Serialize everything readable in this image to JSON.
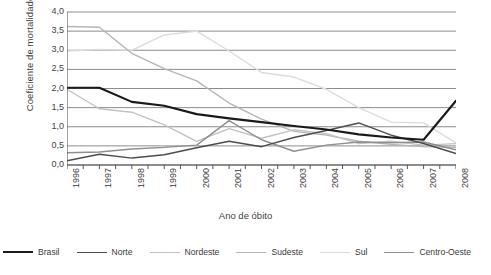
{
  "chart_data": {
    "type": "line",
    "title": "",
    "xlabel": "Ano de óbito",
    "ylabel": "Coeficiente de mortalidade",
    "categories": [
      "1996",
      "1997",
      "1998",
      "1999",
      "2000",
      "2001",
      "2002",
      "2003",
      "2004",
      "2005",
      "2006",
      "2007",
      "2008"
    ],
    "x": [
      1996,
      1997,
      1998,
      1999,
      2000,
      2001,
      2002,
      2003,
      2004,
      2005,
      2006,
      2007,
      2008
    ],
    "ylim": [
      0.0,
      4.0
    ],
    "yticks": [
      "0,0",
      "0,5",
      "1,0",
      "1,5",
      "2,0",
      "2,5",
      "3,0",
      "3,5",
      "4,0"
    ],
    "ytick_values": [
      0.0,
      0.5,
      1.0,
      1.5,
      2.0,
      2.5,
      3.0,
      3.5,
      4.0
    ],
    "grid": true,
    "legend_position": "bottom",
    "series": [
      {
        "name": "Brasil",
        "color": "#1a1a1a",
        "width": 2.1,
        "values": [
          2.02,
          2.02,
          1.65,
          1.55,
          1.33,
          1.22,
          1.12,
          1.02,
          0.93,
          0.8,
          0.72,
          0.66,
          1.68
        ]
      },
      {
        "name": "Norte",
        "color": "#4d4d4d",
        "width": 1.5,
        "values": [
          0.11,
          0.28,
          0.18,
          0.27,
          0.45,
          0.62,
          0.48,
          0.72,
          0.9,
          1.1,
          0.78,
          0.56,
          0.3
        ]
      },
      {
        "name": "Nordeste",
        "color": "#c2c2c2",
        "width": 1.4,
        "values": [
          1.98,
          1.47,
          1.38,
          1.05,
          0.62,
          0.95,
          0.7,
          0.92,
          0.82,
          0.56,
          0.62,
          0.52,
          0.56
        ]
      },
      {
        "name": "Sudeste",
        "color": "#b5b5b5",
        "width": 1.4,
        "values": [
          3.62,
          3.6,
          2.92,
          2.52,
          2.2,
          1.62,
          1.2,
          0.88,
          0.78,
          0.62,
          0.54,
          0.48,
          0.46
        ]
      },
      {
        "name": "Sul",
        "color": "#dcdcdc",
        "width": 1.4,
        "values": [
          2.98,
          3.02,
          3.0,
          3.4,
          3.5,
          2.98,
          2.42,
          2.3,
          1.98,
          1.5,
          1.12,
          1.1,
          0.58
        ]
      },
      {
        "name": "Centro-Oeste",
        "color": "#8f8f8f",
        "width": 1.4,
        "values": [
          0.32,
          0.34,
          0.42,
          0.46,
          0.52,
          1.16,
          0.66,
          0.36,
          0.52,
          0.6,
          0.58,
          0.6,
          0.4
        ]
      }
    ]
  },
  "axes": {
    "y_title": "Coeficiente de mortalidade",
    "x_title": "Ano de óbito",
    "y_tick_labels": [
      "4,0",
      "3,5",
      "3,0",
      "2,5",
      "2,0",
      "1,5",
      "1,0",
      "0,5",
      "0,0"
    ],
    "x_tick_labels": [
      "1996",
      "1997",
      "1998",
      "1999",
      "2000",
      "2001",
      "2002",
      "2003",
      "2004",
      "2005",
      "2006",
      "2007",
      "2008"
    ]
  },
  "legend": {
    "items": [
      {
        "label": "Brasil",
        "color": "#1a1a1a",
        "thickness": 2.2
      },
      {
        "label": "Norte",
        "color": "#4d4d4d",
        "thickness": 1.8
      },
      {
        "label": "Nordeste",
        "color": "#c2c2c2",
        "thickness": 1.4
      },
      {
        "label": "Sudeste",
        "color": "#b5b5b5",
        "thickness": 1.4
      },
      {
        "label": "Sul",
        "color": "#dcdcdc",
        "thickness": 1.4
      },
      {
        "label": "Centro-Oeste",
        "color": "#8f8f8f",
        "thickness": 1.4
      }
    ]
  },
  "style": {
    "axis_color": "#555555",
    "grid_color": "#6e6e6e",
    "background": "#ffffff",
    "text_color": "#3f3f3f"
  }
}
